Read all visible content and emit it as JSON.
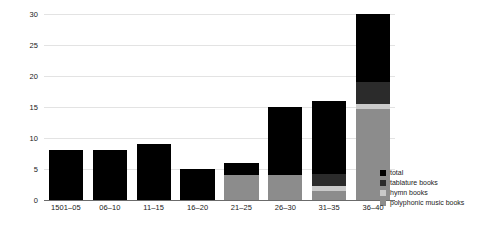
{
  "chart_data": {
    "type": "bar",
    "subtype": "stacked-vertical",
    "title": "",
    "xlabel": "",
    "ylabel": "",
    "ylim": [
      0,
      30
    ],
    "yticks": [
      0,
      5,
      10,
      15,
      20,
      25,
      30
    ],
    "grid": true,
    "legend_position": "right-bottom",
    "categories": [
      "1501–05",
      "06–10",
      "11–15",
      "16–20",
      "21–25",
      "26–30",
      "31–35",
      "36–40"
    ],
    "series": [
      {
        "name": "polyphonic music books",
        "color": "#8c8c8c",
        "values": [
          0,
          0,
          0,
          0,
          4,
          4,
          1.5,
          14.7
        ]
      },
      {
        "name": "hymn books",
        "color": "#c9c9c9",
        "values": [
          0,
          0,
          0,
          0,
          0,
          0,
          0.7,
          0.8
        ]
      },
      {
        "name": "tablature books",
        "color": "#2b2b2b",
        "values": [
          0,
          0,
          0,
          0,
          0,
          0,
          2.0,
          3.5
        ]
      },
      {
        "name": "total",
        "color": "#000000",
        "values": [
          8,
          8,
          9,
          5,
          2,
          11,
          11.8,
          11.0
        ]
      }
    ],
    "totals": [
      8,
      8,
      9,
      5,
      6,
      15,
      16,
      30
    ]
  },
  "legend": {
    "items": [
      {
        "label": "total",
        "color": "#000000"
      },
      {
        "label": "tablature books",
        "color": "#2b2b2b"
      },
      {
        "label": "hymn books",
        "color": "#c9c9c9"
      },
      {
        "label": "polyphonic music books",
        "color": "#8c8c8c"
      }
    ]
  },
  "axis": {
    "y_tick_labels": [
      "0",
      "5",
      "10",
      "15",
      "20",
      "25",
      "30"
    ],
    "x_tick_labels": [
      "1501–05",
      "06–10",
      "11–15",
      "16–20",
      "21–25",
      "26–30",
      "31–35",
      "36–40"
    ]
  },
  "colors": {
    "gridline": "#e3e3e3",
    "axis": "#6b6b6b",
    "text": "#1a1a1a",
    "background": "#ffffff"
  }
}
